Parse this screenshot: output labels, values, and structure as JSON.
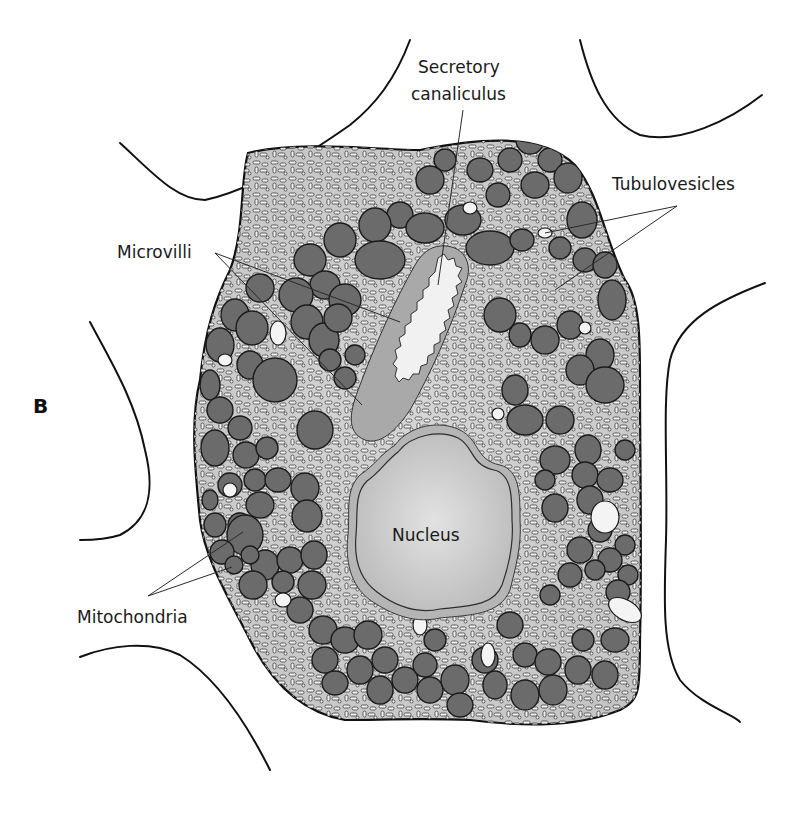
{
  "figure": {
    "panel_letter": "B",
    "labels": {
      "secretory_canaliculus_line1": "Secretory",
      "secretory_canaliculus_line2": "canaliculus",
      "tubulovesicles": "Tubulovesicles",
      "microvilli": "Microvilli",
      "mitochondria": "Mitochondria",
      "nucleus": "Nucleus"
    },
    "colors": {
      "cytoplasm": "#cfcfcf",
      "mitochondria": "#6b6b6b",
      "nucleus": "#c9c9c9",
      "canaliculus_lumen": "#f0f0f0",
      "canaliculus_rim": "#a9a9a9",
      "outline": "#111111",
      "background": "#ffffff"
    }
  }
}
